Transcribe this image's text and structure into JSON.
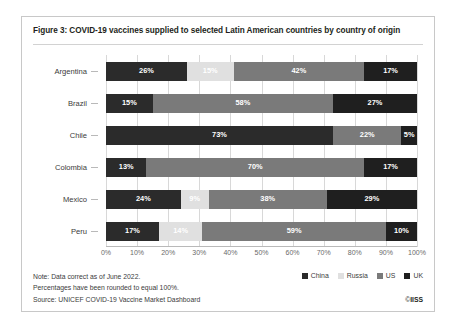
{
  "figure": {
    "title": "Figure 3: COVID-19 vaccines supplied to selected Latin American countries by country of origin",
    "note_line1": "Note: Data correct as of June 2022.",
    "note_line2": "Percentages have been rounded to equal 100%.",
    "source": "Source: UNICEF COVID-19 Vaccine Market Dashboard",
    "copyright_symbol": "©",
    "copyright_owner": "IISS"
  },
  "colors": {
    "china": "#2b2b2b",
    "russia": "#e0e0e0",
    "us": "#7a7a7a",
    "uk": "#1f1f1f",
    "gridline": "#d8d8d8",
    "axis": "#b9b9b9",
    "frame": "#c8c8c8",
    "text": "#3b3b3b"
  },
  "chart_data": {
    "type": "bar",
    "orientation": "horizontal",
    "stacked": true,
    "stack_mode": "percent",
    "title": "Figure 3: COVID-19 vaccines supplied to selected Latin American countries by country of origin",
    "xlabel": "",
    "ylabel": "",
    "xlim": [
      0,
      100
    ],
    "xticks": [
      "0%",
      "10%",
      "20%",
      "30%",
      "40%",
      "50%",
      "60%",
      "70%",
      "80%",
      "90%",
      "100%"
    ],
    "xtick_values": [
      0,
      10,
      20,
      30,
      40,
      50,
      60,
      70,
      80,
      90,
      100
    ],
    "grid": true,
    "legend_position": "bottom-right",
    "categories": [
      "Argentina",
      "Brazil",
      "Chile",
      "Colombia",
      "Mexico",
      "Peru"
    ],
    "series": [
      {
        "name": "China",
        "color": "#2b2b2b",
        "values": [
          26,
          15,
          73,
          13,
          24,
          17
        ]
      },
      {
        "name": "Russia",
        "color": "#e0e0e0",
        "values": [
          15,
          0,
          0,
          0,
          9,
          14
        ]
      },
      {
        "name": "US",
        "color": "#7a7a7a",
        "values": [
          42,
          58,
          22,
          70,
          38,
          59
        ]
      },
      {
        "name": "UK",
        "color": "#1f1f1f",
        "values": [
          17,
          27,
          5,
          17,
          29,
          10
        ]
      }
    ],
    "rows": [
      {
        "category": "Argentina",
        "segments": [
          {
            "series": "China",
            "value": 26,
            "label": "26%",
            "show_label": true
          },
          {
            "series": "Russia",
            "value": 15,
            "label": "15%",
            "show_label": true
          },
          {
            "series": "US",
            "value": 42,
            "label": "42%",
            "show_label": true
          },
          {
            "series": "UK",
            "value": 17,
            "label": "17%",
            "show_label": true
          }
        ]
      },
      {
        "category": "Brazil",
        "segments": [
          {
            "series": "China",
            "value": 15,
            "label": "15%",
            "show_label": true
          },
          {
            "series": "Russia",
            "value": 0,
            "label": "",
            "show_label": false
          },
          {
            "series": "US",
            "value": 58,
            "label": "58%",
            "show_label": true
          },
          {
            "series": "UK",
            "value": 27,
            "label": "27%",
            "show_label": true
          }
        ]
      },
      {
        "category": "Chile",
        "segments": [
          {
            "series": "China",
            "value": 73,
            "label": "73%",
            "show_label": true
          },
          {
            "series": "Russia",
            "value": 0,
            "label": "",
            "show_label": false
          },
          {
            "series": "US",
            "value": 22,
            "label": "22%",
            "show_label": true
          },
          {
            "series": "UK",
            "value": 5,
            "label": "5%",
            "show_label": true
          }
        ]
      },
      {
        "category": "Colombia",
        "segments": [
          {
            "series": "China",
            "value": 13,
            "label": "13%",
            "show_label": true
          },
          {
            "series": "Russia",
            "value": 0,
            "label": "",
            "show_label": false
          },
          {
            "series": "US",
            "value": 70,
            "label": "70%",
            "show_label": true
          },
          {
            "series": "UK",
            "value": 17,
            "label": "17%",
            "show_label": true
          }
        ]
      },
      {
        "category": "Mexico",
        "segments": [
          {
            "series": "China",
            "value": 24,
            "label": "24%",
            "show_label": true
          },
          {
            "series": "Russia",
            "value": 9,
            "label": "9%",
            "show_label": true
          },
          {
            "series": "US",
            "value": 38,
            "label": "38%",
            "show_label": true
          },
          {
            "series": "UK",
            "value": 29,
            "label": "29%",
            "show_label": true
          }
        ]
      },
      {
        "category": "Peru",
        "segments": [
          {
            "series": "China",
            "value": 17,
            "label": "17%",
            "show_label": true
          },
          {
            "series": "Russia",
            "value": 14,
            "label": "14%",
            "show_label": true
          },
          {
            "series": "US",
            "value": 59,
            "label": "59%",
            "show_label": true
          },
          {
            "series": "UK",
            "value": 10,
            "label": "10%",
            "show_label": true
          }
        ]
      }
    ],
    "legend": [
      {
        "label": "China",
        "color": "#2b2b2b"
      },
      {
        "label": "Russia",
        "color": "#e0e0e0"
      },
      {
        "label": "US",
        "color": "#7a7a7a"
      },
      {
        "label": "UK",
        "color": "#1f1f1f"
      }
    ]
  }
}
